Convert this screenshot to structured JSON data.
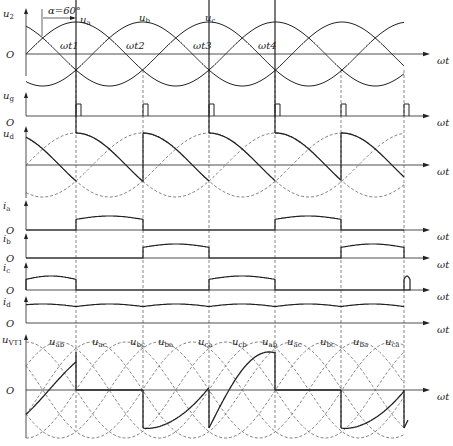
{
  "diagram": {
    "alpha_label": "α=60°",
    "x_axis_label": "ωt",
    "origin_label": "O",
    "phase_labels": [
      "ua",
      "ub",
      "uc"
    ],
    "instant_labels": [
      "ωt1",
      "ωt2",
      "ωt3",
      "ωt4"
    ],
    "panels": [
      {
        "id": "u2",
        "label": "u2",
        "description": "three-phase source voltages ua, ub, uc"
      },
      {
        "id": "ug",
        "label": "ug",
        "description": "gate trigger pulses"
      },
      {
        "id": "ud",
        "label": "ud",
        "description": "output DC voltage"
      },
      {
        "id": "ia",
        "label": "ia",
        "description": "phase a current"
      },
      {
        "id": "ib",
        "label": "ib",
        "description": "phase b current"
      },
      {
        "id": "ic",
        "label": "ic",
        "description": "phase c current"
      },
      {
        "id": "id",
        "label": "id",
        "description": "load current"
      },
      {
        "id": "uVT1",
        "label": "uVT1",
        "description": "voltage across thyristor VT1"
      }
    ],
    "line_voltage_labels": [
      "uab",
      "uac",
      "ubc",
      "uba",
      "uca",
      "ucb",
      "uab",
      "uac",
      "ubc",
      "uba",
      "uca"
    ],
    "colors": {
      "line": "#222222",
      "dashed": "#555555",
      "background": "#ffffff"
    }
  }
}
